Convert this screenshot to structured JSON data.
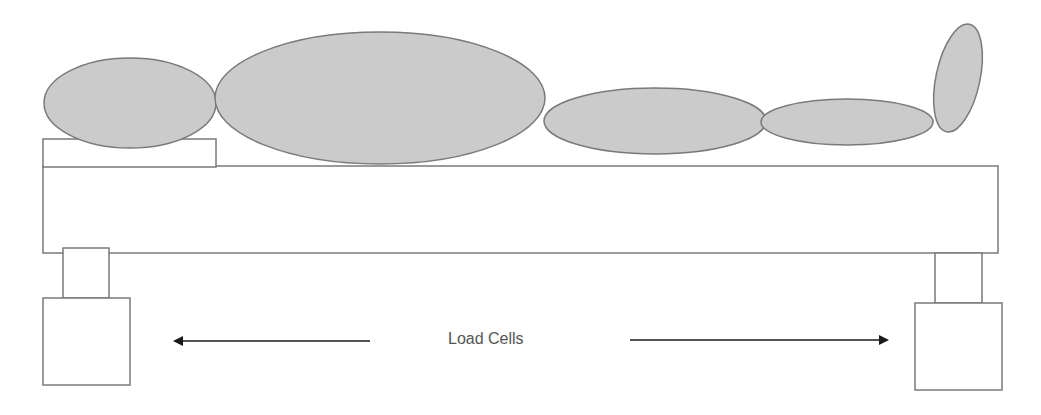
{
  "diagram": {
    "label": "Load Cells",
    "colors": {
      "body_fill": "#cbcbcb",
      "stroke": "#7a7a7a",
      "arrow": "#1a1a1a",
      "text": "#555555",
      "background": "#ffffff"
    },
    "body_segments": [
      {
        "name": "head",
        "cx": 130,
        "cy": 103,
        "rx": 86,
        "ry": 45,
        "rotate": 0
      },
      {
        "name": "torso",
        "cx": 380,
        "cy": 98,
        "rx": 165,
        "ry": 66,
        "rotate": 0
      },
      {
        "name": "thigh",
        "cx": 655,
        "cy": 121,
        "rx": 111,
        "ry": 33,
        "rotate": 0
      },
      {
        "name": "lower-leg",
        "cx": 847,
        "cy": 122,
        "rx": 86,
        "ry": 23,
        "rotate": 0
      },
      {
        "name": "foot",
        "cx": 958,
        "cy": 78,
        "rx": 22,
        "ry": 55,
        "rotate": 12
      }
    ],
    "pillow": {
      "x": 43,
      "y": 139,
      "w": 173,
      "h": 28
    },
    "bed_platform": {
      "x": 43,
      "y": 166,
      "w": 955,
      "h": 87
    },
    "load_cells": [
      {
        "side": "left",
        "leg": {
          "x": 63,
          "y": 248,
          "w": 46,
          "h": 50
        },
        "box": {
          "x": 43,
          "y": 298,
          "w": 87,
          "h": 87
        }
      },
      {
        "side": "right",
        "leg": {
          "x": 935,
          "y": 253,
          "w": 47,
          "h": 50
        },
        "box": {
          "x": 915,
          "y": 303,
          "w": 87,
          "h": 87
        }
      }
    ],
    "arrows": [
      {
        "direction": "left",
        "x1": 370,
        "y1": 341,
        "x2": 175,
        "y2": 341
      },
      {
        "direction": "right",
        "x1": 630,
        "y1": 340,
        "x2": 887,
        "y2": 340
      }
    ]
  }
}
